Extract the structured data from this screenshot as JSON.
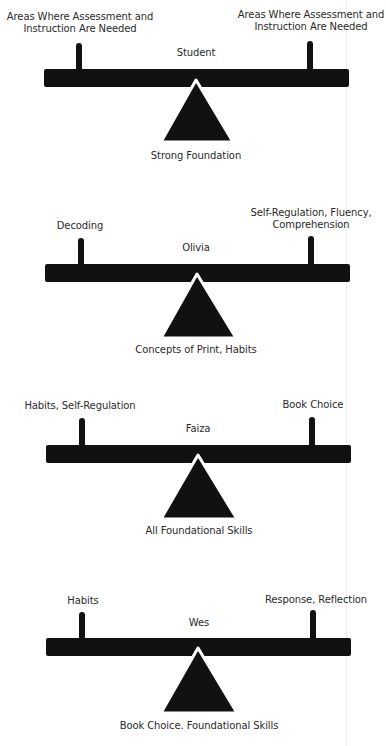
{
  "diagram": {
    "type": "seesaw-balance",
    "seesaws": [
      {
        "center_label": "Student",
        "left_label": "Areas Where Assessment and\nInstruction Are Needed",
        "right_label": "Areas Where Assessment and\nInstruction Are Needed",
        "fulcrum_label": "Strong Foundation"
      },
      {
        "center_label": "Olivia",
        "left_label": "Decoding",
        "right_label": "Self-Regulation, Fluency,\nComprehension",
        "fulcrum_label": "Concepts of Print, Habits"
      },
      {
        "center_label": "Faiza",
        "left_label": "Habits, Self-Regulation",
        "right_label": "Book Choice",
        "fulcrum_label": "All Foundational Skills"
      },
      {
        "center_label": "Wes",
        "left_label": "Habits",
        "right_label": "Response, Reflection",
        "fulcrum_label": "Book Choice. Foundational Skills"
      }
    ],
    "colors": {
      "shape": "#111111",
      "text": "#2b2b2b",
      "background": "#ffffff"
    }
  }
}
